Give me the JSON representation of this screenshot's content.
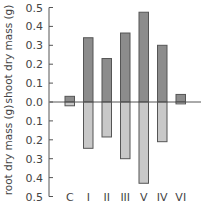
{
  "chart_data": {
    "type": "bar",
    "subtype": "mirrored-bar",
    "categories": [
      "C",
      "I",
      "II",
      "III",
      "V",
      "IV",
      "VI"
    ],
    "series": [
      {
        "name": "shoot dry mass (g)",
        "direction": "up",
        "color": "#8c8c8c",
        "values": [
          0.03,
          0.34,
          0.23,
          0.365,
          0.475,
          0.3,
          0.04
        ]
      },
      {
        "name": "root dry mass (g)",
        "direction": "down",
        "color": "#c8c8c8",
        "values": [
          0.02,
          0.245,
          0.185,
          0.3,
          0.43,
          0.21,
          0.01
        ]
      }
    ],
    "upper_axis": {
      "label": "shoot dry mass (g)",
      "ticks": [
        "0.0",
        "0.1",
        "0.2",
        "0.3",
        "0.4",
        "0.5"
      ],
      "range": [
        0,
        0.5
      ]
    },
    "lower_axis": {
      "label": "root dry mass (g)",
      "ticks": [
        "0.1",
        "0.2",
        "0.3",
        "0.4",
        "0.5"
      ],
      "range": [
        0,
        0.5
      ]
    },
    "grid": false,
    "legend": "none"
  }
}
